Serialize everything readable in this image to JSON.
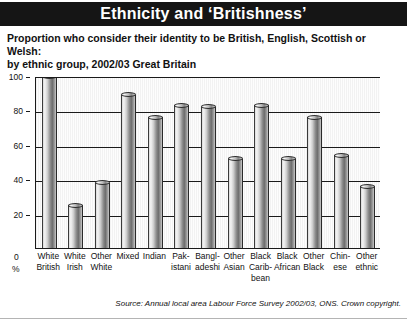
{
  "header": {
    "title": "Ethnicity and ‘Britishness’"
  },
  "subtitle": {
    "line1": "Proportion who consider their identity to be British, English, Scottish or Welsh:",
    "line2": "by ethnic group, 2002/03 Great Britain"
  },
  "axis": {
    "y_ticks": [
      "100",
      "80",
      "60",
      "40",
      "20"
    ],
    "origin_label": "0",
    "unit_label": "%"
  },
  "source": {
    "text": "Source: Annual local area Labour Force Survey 2002/03, ONS. Crown copyright."
  },
  "colors": {
    "header_band": "#151515",
    "plot_background": "#f2f2f2",
    "axis_line": "#1a1a1a",
    "bar_light": "#f4f4f4",
    "bar_dark": "#6d6d6d",
    "text": "#111111"
  },
  "chart_data": {
    "type": "bar",
    "title": "Ethnicity and ‘Britishness’",
    "subtitle": "Proportion who consider their identity to be British, English, Scottish or Welsh: by ethnic group, 2002/03 Great Britain",
    "xlabel": "",
    "ylabel": "%",
    "ylim": [
      0,
      100
    ],
    "yticks": [
      0,
      20,
      40,
      60,
      80,
      100
    ],
    "grid": true,
    "legend": "none",
    "categories": [
      "White British",
      "White Irish",
      "Other White",
      "Mixed",
      "Indian",
      "Pakistani",
      "Bangladeshi",
      "Other Asian",
      "Black Caribbean",
      "Black African",
      "Other Black",
      "Chinese",
      "Other ethnic"
    ],
    "category_lines": [
      [
        "White",
        "British"
      ],
      [
        "White",
        "Irish"
      ],
      [
        "Other",
        "White"
      ],
      [
        "Mixed",
        ""
      ],
      [
        "Indian",
        ""
      ],
      [
        "Pak-",
        "istani"
      ],
      [
        "Bangl-",
        "adeshi"
      ],
      [
        "Other",
        "Asian"
      ],
      [
        "Black",
        "Carib-",
        "bean"
      ],
      [
        "Black",
        "African"
      ],
      [
        "Other",
        "Black"
      ],
      [
        "Chin-",
        "ese"
      ],
      [
        "Other",
        "ethnic"
      ]
    ],
    "values": [
      100,
      25,
      38,
      89,
      76,
      83,
      82,
      52,
      83,
      52,
      76,
      54,
      36
    ]
  }
}
